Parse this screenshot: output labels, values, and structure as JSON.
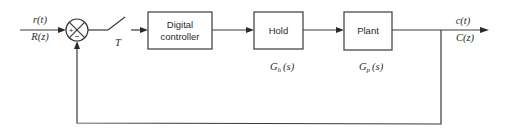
{
  "diagram": {
    "type": "block_diagram",
    "input": {
      "time_label": "r(t)",
      "z_label": "R(z)"
    },
    "summing_junction": {
      "plus_sign": "+",
      "minus_sign": "−"
    },
    "sampler": {
      "label": "T"
    },
    "blocks": [
      {
        "id": "digital-controller",
        "line1": "Digital",
        "line2": "controller",
        "transfer_label": ""
      },
      {
        "id": "hold",
        "line1": "Hold",
        "transfer_label_main": "G",
        "transfer_label_sub": "h",
        "transfer_label_arg": "(s)"
      },
      {
        "id": "plant",
        "line1": "Plant",
        "transfer_label_main": "G",
        "transfer_label_sub": "p",
        "transfer_label_arg": "(s)"
      }
    ],
    "output": {
      "time_label": "c(t)",
      "z_label": "C(z)"
    },
    "feedback": "unity negative feedback from output to summing junction"
  },
  "colors": {
    "line": "#3a3a3a",
    "text": "#2a2a2a",
    "background": "#ffffff"
  }
}
